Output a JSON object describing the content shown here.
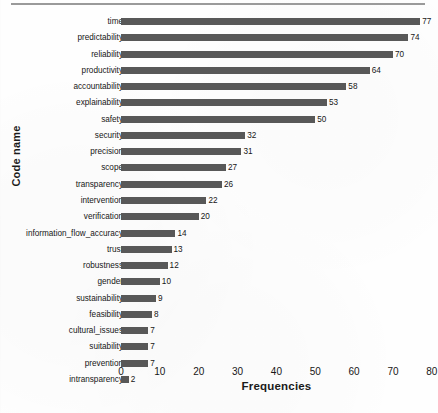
{
  "chart_data": {
    "type": "bar",
    "orientation": "horizontal",
    "title": "",
    "xlabel": "Frequencies",
    "ylabel": "Code name",
    "xlim": [
      0,
      80
    ],
    "xticks": [
      0,
      10,
      20,
      30,
      40,
      50,
      60,
      70,
      80
    ],
    "grid": false,
    "legend": null,
    "bar_color": "#585858",
    "show_value_labels": true,
    "categories": [
      "time",
      "predictability",
      "reliability",
      "productivity",
      "accountability",
      "explainability",
      "safety",
      "security",
      "precision",
      "scope",
      "transparency",
      "intervention",
      "verification",
      "information_flow_accuracy",
      "trust",
      "robustness",
      "gender",
      "sustainability",
      "feasibility",
      "cultural_issues",
      "suitability",
      "prevention",
      "intransparency"
    ],
    "values": [
      77,
      74,
      70,
      64,
      58,
      53,
      50,
      32,
      31,
      27,
      26,
      22,
      20,
      14,
      13,
      12,
      10,
      9,
      8,
      7,
      7,
      7,
      2
    ]
  }
}
